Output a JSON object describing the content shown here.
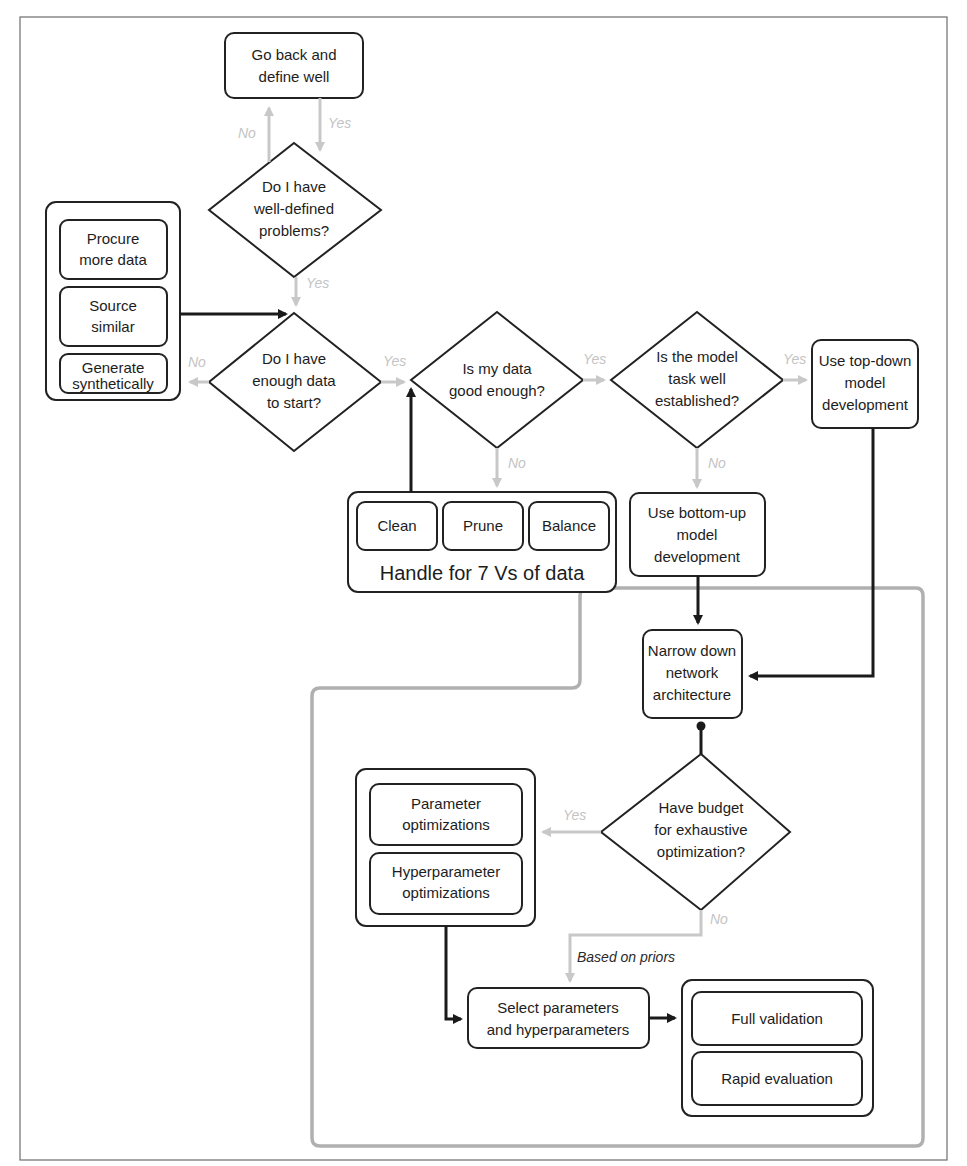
{
  "diagram": {
    "type": "flowchart",
    "nodes": {
      "go_back": [
        "Go back and",
        "define well"
      ],
      "q_well_defined": [
        "Do I have",
        "well-defined",
        "problems?"
      ],
      "procure": [
        "Procure",
        "more data"
      ],
      "source": [
        "Source",
        "similar"
      ],
      "generate": [
        "Generate",
        "synthetically"
      ],
      "q_enough_data": [
        "Do I have",
        "enough data",
        "to start?"
      ],
      "q_data_good": [
        "Is my data",
        "good enough?"
      ],
      "q_task_established": [
        "Is the model",
        "task well",
        "established?"
      ],
      "top_down": [
        "Use top-down",
        "model",
        "development"
      ],
      "clean": "Clean",
      "prune": "Prune",
      "balance": "Balance",
      "handle_7vs": "Handle for 7 Vs of data",
      "bottom_up": [
        "Use bottom-up",
        "model",
        "development"
      ],
      "narrow_down": [
        "Narrow down",
        "network",
        "architecture"
      ],
      "q_budget": [
        "Have budget",
        "for exhaustive",
        "optimization?"
      ],
      "param_opt": [
        "Parameter",
        "optimizations"
      ],
      "hyperparam_opt": [
        "Hyperparameter",
        "optimizations"
      ],
      "select_params": [
        "Select parameters",
        "and hyperparameters"
      ],
      "full_validation": "Full validation",
      "rapid_evaluation": "Rapid evaluation"
    },
    "edge_labels": {
      "no": "No",
      "yes": "Yes",
      "based_on_priors": "Based on priors"
    },
    "colors": {
      "dark_edge": "#1a1a1a",
      "light_edge": "#c8c8c8",
      "region_outline": "#b0b0b0",
      "node_stroke": "#222222"
    }
  }
}
